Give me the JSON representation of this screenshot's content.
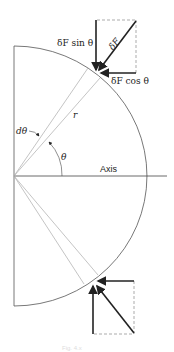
{
  "diagram": {
    "type": "force-resolution-on-hemispherical-surface",
    "labels": {
      "force_sin": "δF sin θ",
      "force": "δF",
      "force_cos": "δF cos θ",
      "radius": "r",
      "d_theta": "dθ",
      "theta": "θ",
      "axis": "Axis"
    },
    "caption": "Fig. 4.x",
    "colors": {
      "stroke": "#555555",
      "thin_line": "#aaaaaa",
      "vector": "#222222",
      "dashed": "#888888"
    }
  }
}
